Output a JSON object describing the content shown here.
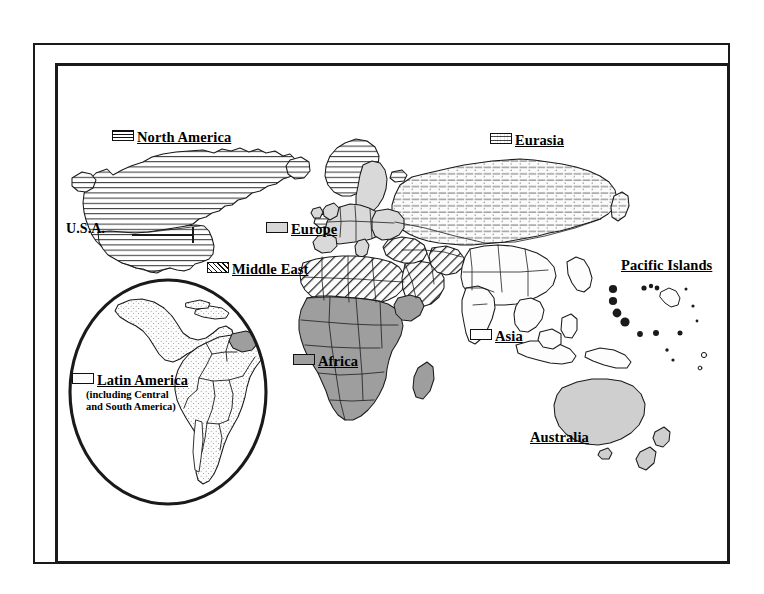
{
  "figure": {
    "kind": "world-regions-map",
    "background_color": "#ffffff",
    "frame_color": "#1a1a1a",
    "ocean_color": "#ffffff",
    "outline_color": "#1a1a1a"
  },
  "legend": {
    "north_america": {
      "label": "North America",
      "pattern": "horizontal-lines",
      "swatch_class": "sw-hlines"
    },
    "usa": {
      "label": "U.S.A.",
      "pattern": "leader-line",
      "swatch_class": "none"
    },
    "eurasia": {
      "label": "Eurasia",
      "pattern": "dashed-horizontal-lines",
      "swatch_class": "sw-dash"
    },
    "europe": {
      "label": "Europe",
      "pattern": "light-gray-fill",
      "swatch_class": "sw-gray-light",
      "color": "#d7d7d7"
    },
    "middle_east": {
      "label": "Middle East",
      "pattern": "diagonal-hatch",
      "swatch_class": "sw-diag"
    },
    "africa": {
      "label": "Africa",
      "pattern": "mid-gray-fill",
      "swatch_class": "sw-gray-mid",
      "color": "#9e9e9e"
    },
    "asia": {
      "label": "Asia",
      "pattern": "white-fill",
      "swatch_class": "sw-white",
      "color": "#fdfdfd"
    },
    "australia": {
      "label": "Australia",
      "pattern": "light-gray-fill-no-swatch",
      "swatch_class": "none",
      "color": "#cfcfcf"
    },
    "pacific_islands": {
      "label": "Pacific Islands",
      "pattern": "solid-dots-no-swatch",
      "swatch_class": "none"
    },
    "latin_america": {
      "label": "Latin America",
      "sub_line_1": "(including Central",
      "sub_line_2": "and South America)",
      "pattern": "stippled-white-fill",
      "swatch_class": "sw-white"
    }
  },
  "inset": {
    "name": "latin-america-magnifier",
    "shape": "circle"
  }
}
